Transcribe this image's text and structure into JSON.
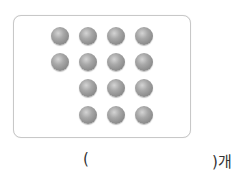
{
  "figure": {
    "dot_color": "#999999",
    "rows": [
      {
        "count": 4,
        "start_col": 0
      },
      {
        "count": 4,
        "start_col": 0
      },
      {
        "count": 3,
        "start_col": 1
      },
      {
        "count": 3,
        "start_col": 1
      }
    ],
    "total_dots": 14
  },
  "answer": {
    "open_paren": "(",
    "close_with_unit": ")개",
    "value": ""
  }
}
